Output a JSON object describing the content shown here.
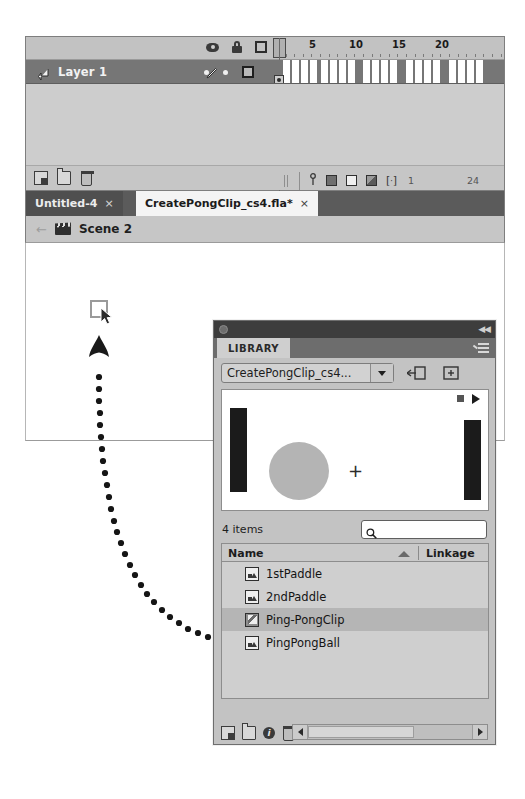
{
  "timeline": {
    "layer": {
      "name": "Layer 1"
    },
    "header_icons": [
      "eye-icon",
      "lock-icon",
      "outline-square-icon"
    ],
    "ruler_labels": [
      "1",
      "5",
      "10",
      "15",
      "20"
    ],
    "ruler_positions": [
      2,
      36,
      79,
      122,
      165
    ],
    "footer": {
      "left_icons": [
        "new-layer-icon",
        "new-folder-icon",
        "delete-layer-icon"
      ],
      "onion_icons": [
        "center-frame-icon",
        "onion-skin-icon",
        "onion-skin-outlines-icon",
        "edit-multiple-frames-icon",
        "modify-onion-markers-icon"
      ],
      "current_frame": "1",
      "end_frame": "24"
    }
  },
  "doc_tabs": [
    {
      "label": "Untitled-4",
      "close": "×",
      "active": false
    },
    {
      "label": "CreatePongClip_cs4.fla*",
      "close": "×",
      "active": true
    }
  ],
  "scene_bar": {
    "back_icon": "back-arrow-icon",
    "scene_icon": "clapper-board-icon",
    "scene_name": "Scene 2"
  },
  "stage": {
    "drop_target": "empty-symbol-placeholder",
    "cursor": "arrow-cursor-icon",
    "drag_arrow": "drag-direction-arrow",
    "drag_trail": "dotted-drag-path"
  },
  "library": {
    "title_bar": {
      "grip_icon": "panel-grip-icon",
      "collapse_icon": "collapse-panel-icon",
      "collapse_glyph": "◀◀"
    },
    "tab_label": "LIBRARY",
    "panel_menu_icon": "panel-menu-icon",
    "document_select": {
      "value": "CreatePongClip_cs4...",
      "caret_icon": "chevron-down-icon"
    },
    "pin_button": "pin-current-library-icon",
    "new_library_panel_button": "new-library-panel-icon",
    "preview": {
      "stop_icon": "stop-button-icon",
      "play_icon": "play-button-icon",
      "plus_icon": "registration-cross-icon"
    },
    "item_count": "4 items",
    "search_placeholder": "",
    "search_value": "",
    "search_icon": "search-icon",
    "columns": {
      "name": "Name",
      "linkage": "Linkage",
      "sort_icon": "sort-ascending-icon"
    },
    "items": [
      {
        "name": "1stPaddle",
        "kind": "graphic",
        "selected": false
      },
      {
        "name": "2ndPaddle",
        "kind": "graphic",
        "selected": false
      },
      {
        "name": "Ping-PongClip",
        "kind": "movieclip",
        "selected": true
      },
      {
        "name": "PingPongBall",
        "kind": "graphic",
        "selected": false
      }
    ],
    "footer": {
      "icons": [
        "new-symbol-icon",
        "new-folder-icon",
        "properties-icon",
        "delete-icon"
      ],
      "properties_glyph": "i",
      "scroll_left_icon": "scroll-left-arrow",
      "scroll_right_icon": "scroll-right-arrow"
    }
  }
}
